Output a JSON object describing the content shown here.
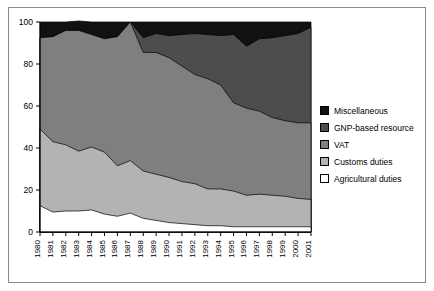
{
  "chart_data": {
    "type": "area",
    "stacked": true,
    "normalized_percent": true,
    "title": "",
    "subtitle": "",
    "xlabel": "",
    "ylabel": "",
    "xlim": [
      1980,
      2001
    ],
    "ylim": [
      0,
      100
    ],
    "yticks": [
      0,
      20,
      40,
      60,
      80,
      100
    ],
    "ytick_labels": [
      "0",
      "20",
      "40",
      "60",
      "80",
      "100"
    ],
    "grid": false,
    "legend_position": "right",
    "categories": [
      "1980",
      "1981",
      "1982",
      "1983",
      "1984",
      "1985",
      "1986",
      "1987",
      "1988",
      "1989",
      "1990",
      "1991",
      "1992",
      "1993",
      "1994",
      "1995",
      "1996",
      "1997",
      "1998",
      "1999",
      "2000",
      "2001"
    ],
    "series": [
      {
        "name": "Agricultural duties",
        "color": "#ffffff",
        "stack_order": 1,
        "values": [
          12.5,
          9.5,
          10.0,
          10.0,
          10.5,
          8.5,
          7.5,
          9.0,
          6.5,
          5.5,
          4.5,
          4.0,
          3.5,
          3.0,
          3.0,
          2.5,
          2.5,
          2.5,
          2.5,
          2.5,
          2.5,
          2.5
        ]
      },
      {
        "name": "Customs duties",
        "color": "#b3b3b3",
        "stack_order": 2,
        "values": [
          36.5,
          33.5,
          31.5,
          28.5,
          30.0,
          29.5,
          24.0,
          25.0,
          22.5,
          22.0,
          21.5,
          20.0,
          19.5,
          17.5,
          17.5,
          17.0,
          15.0,
          15.5,
          15.0,
          14.5,
          13.5,
          13.0
        ]
      },
      {
        "name": "VAT",
        "color": "#7f7f7f",
        "stack_order": 3,
        "values": [
          43.5,
          50.0,
          54.5,
          57.5,
          53.5,
          54.0,
          61.5,
          66.0,
          56.5,
          58.0,
          57.0,
          55.0,
          52.0,
          52.5,
          49.5,
          42.0,
          41.5,
          39.5,
          37.0,
          36.0,
          36.0,
          36.5
        ]
      },
      {
        "name": "GNP-based resource",
        "color": "#4d4d4d",
        "stack_order": 4,
        "values": [
          0.0,
          0.0,
          0.0,
          0.0,
          0.0,
          0.0,
          0.0,
          0.0,
          7.0,
          9.0,
          10.5,
          15.0,
          19.5,
          21.0,
          23.5,
          32.5,
          29.5,
          34.5,
          38.0,
          40.5,
          42.5,
          45.5
        ]
      },
      {
        "name": "Miscellaneous",
        "color": "#111111",
        "stack_order": 5,
        "values": [
          7.5,
          7.0,
          4.0,
          4.5,
          6.0,
          8.0,
          7.0,
          0.0,
          7.5,
          5.5,
          6.5,
          6.0,
          5.5,
          6.0,
          6.5,
          6.0,
          11.5,
          8.0,
          7.5,
          6.5,
          5.5,
          2.5
        ]
      }
    ]
  },
  "legend": {
    "items": [
      {
        "label": "Miscellaneous",
        "color": "#111111"
      },
      {
        "label": "GNP-based resource",
        "color": "#4d4d4d"
      },
      {
        "label": "VAT",
        "color": "#7f7f7f"
      },
      {
        "label": "Customs duties",
        "color": "#b3b3b3"
      },
      {
        "label": "Agricultural duties",
        "color": "#ffffff"
      }
    ]
  },
  "axes": {
    "y_tick_labels": [
      "100",
      "80",
      "60",
      "40",
      "20",
      "0"
    ],
    "x_tick_labels": [
      "1980",
      "1981",
      "1982",
      "1983",
      "1984",
      "1985",
      "1986",
      "1987",
      "1988",
      "1989",
      "1990",
      "1991",
      "1992",
      "1993",
      "1994",
      "1995",
      "1996",
      "1997",
      "1998",
      "1999",
      "2000",
      "2001"
    ]
  },
  "colors": {
    "frame": "#8a8a8a",
    "axis": "#000000",
    "background": "#ffffff"
  }
}
